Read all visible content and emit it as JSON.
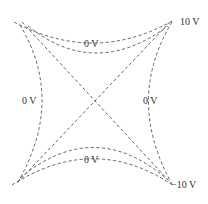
{
  "diagram": {
    "type": "equipotential-lines",
    "labels": {
      "top": "0 V",
      "left": "0 V",
      "right": "0 V",
      "bottom": "0 V",
      "top_right": "10 V",
      "bottom_right": "−10 V"
    },
    "colors": {
      "line": "#555555",
      "text": "#333333",
      "background": "#ffffff"
    }
  }
}
